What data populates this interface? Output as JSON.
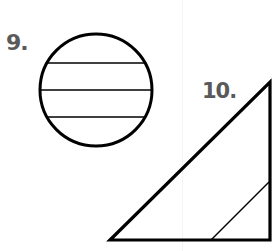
{
  "figures": [
    {
      "label": "9.",
      "shape": "circle",
      "center": [
        96,
        90
      ],
      "radius": 56,
      "chords_y": [
        63,
        90,
        117
      ]
    },
    {
      "label": "10.",
      "shape": "right-triangle",
      "vertices": [
        [
          110,
          240
        ],
        [
          270,
          82
        ],
        [
          270,
          240
        ]
      ],
      "inner_line": [
        [
          211,
          240
        ],
        [
          269,
          182
        ]
      ]
    }
  ],
  "colors": {
    "stroke": "#000000",
    "label": "#5a5a5a",
    "background": "#ffffff"
  }
}
